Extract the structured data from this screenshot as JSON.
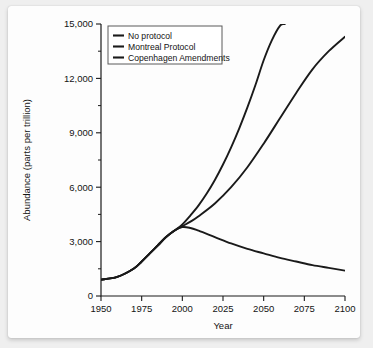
{
  "chart_data": {
    "type": "line",
    "title": "",
    "xlabel": "Year",
    "ylabel": "Abundance (parts per trillion)",
    "xlim": [
      1950,
      2100
    ],
    "ylim": [
      0,
      15000
    ],
    "xticks": [
      1950,
      1975,
      2000,
      2025,
      2050,
      2075,
      2100
    ],
    "xticklabels": [
      "1950",
      "1975",
      "2000",
      "2025",
      "2050",
      "2075",
      "2100"
    ],
    "yticks": [
      0,
      3000,
      6000,
      9000,
      12000,
      15000
    ],
    "yticklabels": [
      "0",
      "3,000",
      "6,000",
      "9,000",
      "12,000",
      "15,000"
    ],
    "yminorticks": [
      1500,
      4500,
      7500,
      10500,
      13500
    ],
    "grid": false,
    "legend_position": "upper left",
    "series": [
      {
        "name": "No protocol",
        "color": "#1a1a1a",
        "x": [
          1950,
          1960,
          1970,
          1975,
          1980,
          1985,
          1990,
          1995,
          2000,
          2005,
          2010,
          2015,
          2020,
          2025,
          2030,
          2035,
          2040,
          2045,
          2050,
          2055,
          2060,
          2063
        ],
        "y": [
          900,
          1050,
          1500,
          1900,
          2350,
          2800,
          3250,
          3600,
          3950,
          4450,
          5000,
          5650,
          6400,
          7250,
          8200,
          9250,
          10400,
          11650,
          13000,
          14100,
          14900,
          15000
        ]
      },
      {
        "name": "Montreal Protocol",
        "color": "#1a1a1a",
        "x": [
          1950,
          1960,
          1970,
          1975,
          1980,
          1985,
          1990,
          1995,
          2000,
          2005,
          2010,
          2020,
          2030,
          2040,
          2050,
          2060,
          2070,
          2080,
          2090,
          2100
        ],
        "y": [
          900,
          1050,
          1500,
          1900,
          2350,
          2800,
          3250,
          3600,
          3850,
          4100,
          4400,
          5100,
          6000,
          7100,
          8400,
          9800,
          11200,
          12500,
          13500,
          14300
        ]
      },
      {
        "name": "Copenhagen Amendments",
        "color": "#1a1a1a",
        "x": [
          1950,
          1960,
          1970,
          1975,
          1980,
          1985,
          1990,
          1995,
          2000,
          2005,
          2010,
          2020,
          2030,
          2040,
          2050,
          2060,
          2070,
          2080,
          2090,
          2100
        ],
        "y": [
          900,
          1050,
          1500,
          1900,
          2350,
          2800,
          3250,
          3600,
          3800,
          3750,
          3600,
          3250,
          2900,
          2600,
          2350,
          2100,
          1900,
          1700,
          1550,
          1400
        ]
      }
    ]
  }
}
